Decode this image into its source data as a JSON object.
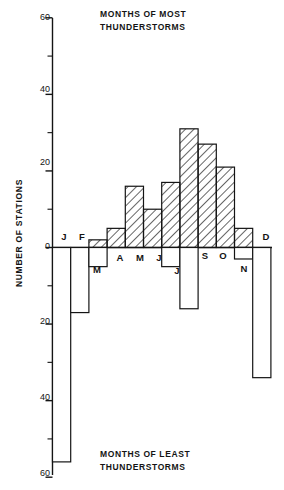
{
  "chart_data": {
    "type": "bar",
    "title_top_line1": "MONTHS OF MOST",
    "title_top_line2": "THUNDERSTORMS",
    "title_bottom_line1": "MONTHS OF LEAST",
    "title_bottom_line2": "THUNDERSTORMS",
    "xlabel": "",
    "ylabel": "NUMBER OF STATIONS",
    "categories": [
      "J",
      "F",
      "M",
      "A",
      "M",
      "J",
      "J",
      "A",
      "S",
      "O",
      "N",
      "D"
    ],
    "month_names": [
      "January",
      "February",
      "March",
      "April",
      "May",
      "June",
      "July",
      "August",
      "September",
      "October",
      "November",
      "December"
    ],
    "ylim": [
      -60,
      60
    ],
    "ytick_values_up": [
      0,
      20,
      40,
      60
    ],
    "ytick_values_down": [
      0,
      20,
      40,
      60
    ],
    "ytick_labels_up": [
      "0",
      "20",
      "40",
      "60"
    ],
    "ytick_labels_down": [
      "0",
      "20",
      "40",
      "60"
    ],
    "minor_tick_interval": 10,
    "grid": false,
    "legend": "none",
    "series": [
      {
        "name": "MONTHS OF MOST THUNDERSTORMS",
        "direction": "up",
        "fill": "hatched-diagonal",
        "values": [
          0,
          0,
          2,
          5,
          16,
          10,
          17,
          31,
          27,
          21,
          5,
          0
        ]
      },
      {
        "name": "MONTHS OF LEAST THUNDERSTORMS",
        "direction": "down",
        "fill": "white",
        "values": [
          56,
          17,
          5,
          0,
          0,
          0,
          5,
          16,
          0,
          0,
          3,
          34
        ]
      }
    ],
    "month_label_placement": {
      "above_axis": [
        "J",
        "F",
        "S",
        "O",
        "D"
      ],
      "below_axis": [
        "M",
        "A",
        "M",
        "J",
        "J",
        "A",
        "N"
      ]
    }
  },
  "style": {
    "line_color": "#141414",
    "hatch_color": "#141414",
    "background": "#ffffff"
  }
}
